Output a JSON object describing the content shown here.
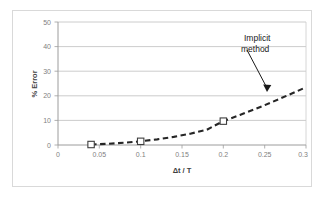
{
  "chart_data": {
    "type": "line",
    "title": "",
    "xlabel": "Δt / T",
    "ylabel": "% Error",
    "xlim": [
      0,
      0.3
    ],
    "ylim": [
      0,
      50
    ],
    "xticks": [
      "0",
      "0.05",
      "0.1",
      "0.15",
      "0.2",
      "0.25",
      "0.3"
    ],
    "xtick_values": [
      0,
      0.05,
      0.1,
      0.15,
      0.2,
      0.25,
      0.3
    ],
    "yticks": [
      "0",
      "10",
      "20",
      "30",
      "40",
      "50"
    ],
    "ytick_values": [
      0,
      10,
      20,
      30,
      40,
      50
    ],
    "grid": "horizontal",
    "legend": "none",
    "series": [
      {
        "name": "Implicit method",
        "style": "dashed",
        "color": "#262626",
        "marker": "open-square",
        "markers": [
          {
            "x": 0.04,
            "y": 0.2
          },
          {
            "x": 0.1,
            "y": 1.5
          },
          {
            "x": 0.2,
            "y": 9.7
          }
        ],
        "x": [
          0.04,
          0.06,
          0.08,
          0.1,
          0.12,
          0.14,
          0.16,
          0.18,
          0.2,
          0.22,
          0.24,
          0.26,
          0.28,
          0.3
        ],
        "values": [
          0.2,
          0.5,
          0.9,
          1.5,
          2.3,
          3.3,
          4.6,
          6.2,
          9.7,
          12.2,
          14.8,
          17.6,
          20.5,
          23.5
        ]
      }
    ],
    "annotations": [
      {
        "text_line1": "Implicit",
        "text_line2": "method",
        "target_x": 0.276,
        "target_y": 20.5
      }
    ]
  },
  "colors": {
    "axis": "#9c9c9c",
    "gridline": "#bfbfbf",
    "curve": "#262626",
    "tick_text": "#7f7f7f",
    "title_text": "#3f3f3f",
    "frame": "#d9d9d9",
    "background": "#ffffff"
  }
}
